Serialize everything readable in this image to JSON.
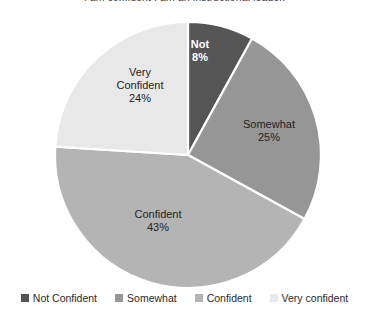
{
  "chart_data": {
    "type": "pie",
    "title": "I am confident I am an instructional leader.",
    "xlabel": "",
    "ylabel": "",
    "grid": false,
    "legend_position": "bottom",
    "start_angle_deg": 0,
    "direction": "clockwise",
    "categories": [
      "Not Confident",
      "Somewhat",
      "Confident",
      "Very confident"
    ],
    "values": [
      8,
      25,
      43,
      24
    ],
    "value_suffix": "%",
    "colors": [
      "#555555",
      "#969696",
      "#b4b4b4",
      "#e8e8e8"
    ],
    "slices": [
      {
        "name": "Not Confident",
        "label_line1": "Not",
        "label_line2": "8%",
        "value": 8,
        "color": "#555555",
        "label_on_dark": true
      },
      {
        "name": "Somewhat",
        "label_line1": "Somewhat",
        "label_line2": "25%",
        "value": 25,
        "color": "#969696",
        "label_on_dark": false
      },
      {
        "name": "Confident",
        "label_line1": "Confident",
        "label_line2": "43%",
        "value": 43,
        "color": "#b4b4b4",
        "label_on_dark": false
      },
      {
        "name": "Very confident",
        "label_line1": "Very",
        "label_line1b": "Confident",
        "label_line2": "24%",
        "value": 24,
        "color": "#e8e8e8",
        "label_on_dark": false
      }
    ]
  },
  "legend": {
    "items": [
      {
        "label": "Not Confident",
        "color": "#555555"
      },
      {
        "label": "Somewhat",
        "color": "#969696"
      },
      {
        "label": "Confident",
        "color": "#b4b4b4"
      },
      {
        "label": "Very confident",
        "color": "#e8e8e8"
      }
    ]
  },
  "geometry": {
    "center_x": 188,
    "center_y": 155,
    "radius": 133
  }
}
